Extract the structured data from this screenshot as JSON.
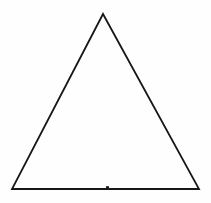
{
  "figure": {
    "shape_name": "isosceles-triangle",
    "background_color": "#fefefe",
    "stroke_color": "#171717",
    "stroke_width": 1.8,
    "fill": "none",
    "canvas": {
      "width": 211,
      "height": 203
    },
    "vertices": [
      {
        "name": "apex",
        "x": 103,
        "y": 14
      },
      {
        "name": "bottom-right",
        "x": 199,
        "y": 189
      },
      {
        "name": "bottom-left",
        "x": 12,
        "y": 189
      }
    ],
    "points_attr": "103,14 199,189 12,189",
    "marks": [
      {
        "name": "baseline-tick",
        "x": 107,
        "y": 187,
        "width": 3,
        "height": 3,
        "color": "#1c1c1c"
      }
    ]
  }
}
